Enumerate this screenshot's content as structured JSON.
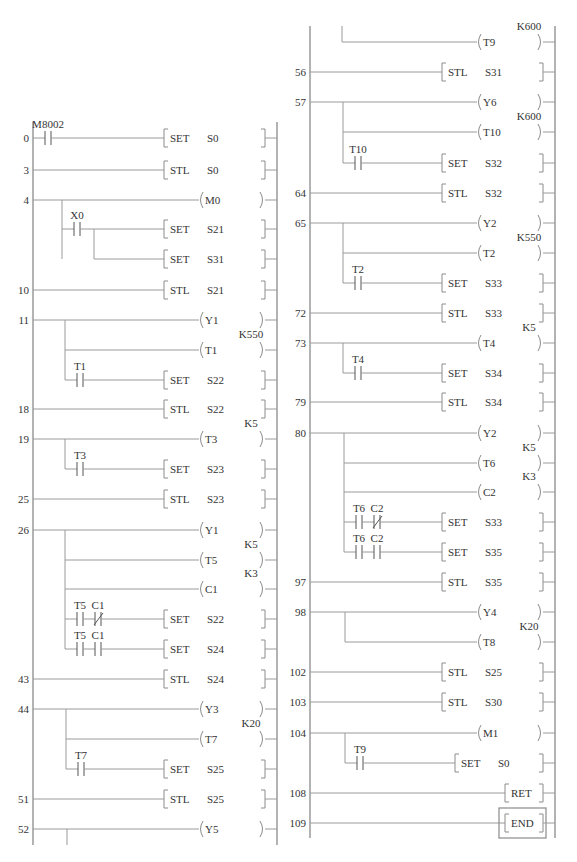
{
  "diagram": {
    "type": "plc-ladder-diagram-stl",
    "columns": [
      {
        "name": "left",
        "rungs": [
          {
            "step": "0",
            "contacts": [
              {
                "label": "M8002",
                "type": "NO"
              }
            ],
            "output": {
              "kind": "instr",
              "op": "SET",
              "operand": "S0"
            }
          },
          {
            "step": "3",
            "output": {
              "kind": "instr",
              "op": "STL",
              "operand": "S0"
            }
          },
          {
            "step": "4",
            "output": {
              "kind": "coil",
              "operand": "M0"
            }
          },
          {
            "branch_of": "4",
            "contacts": [
              {
                "label": "X0",
                "type": "NO"
              }
            ],
            "output": {
              "kind": "instr",
              "op": "SET",
              "operand": "S21"
            }
          },
          {
            "branch_of": "4",
            "output": {
              "kind": "instr",
              "op": "SET",
              "operand": "S31"
            }
          },
          {
            "step": "10",
            "output": {
              "kind": "instr",
              "op": "STL",
              "operand": "S21"
            }
          },
          {
            "step": "11",
            "output": {
              "kind": "coil",
              "operand": "Y1"
            }
          },
          {
            "branch_of": "11",
            "output": {
              "kind": "coil",
              "operand": "T1",
              "preset": "K550"
            }
          },
          {
            "branch_of": "11",
            "contacts": [
              {
                "label": "T1",
                "type": "NO"
              }
            ],
            "output": {
              "kind": "instr",
              "op": "SET",
              "operand": "S22"
            }
          },
          {
            "step": "18",
            "output": {
              "kind": "instr",
              "op": "STL",
              "operand": "S22"
            }
          },
          {
            "step": "19",
            "output": {
              "kind": "coil",
              "operand": "T3",
              "preset": "K5"
            }
          },
          {
            "branch_of": "19",
            "contacts": [
              {
                "label": "T3",
                "type": "NO"
              }
            ],
            "output": {
              "kind": "instr",
              "op": "SET",
              "operand": "S23"
            }
          },
          {
            "step": "25",
            "output": {
              "kind": "instr",
              "op": "STL",
              "operand": "S23"
            }
          },
          {
            "step": "26",
            "output": {
              "kind": "coil",
              "operand": "Y1"
            }
          },
          {
            "branch_of": "26",
            "output": {
              "kind": "coil",
              "operand": "T5",
              "preset": "K5"
            }
          },
          {
            "branch_of": "26",
            "output": {
              "kind": "coil",
              "operand": "C1",
              "preset": "K3"
            }
          },
          {
            "branch_of": "26",
            "contacts": [
              {
                "label": "T5",
                "type": "NO"
              },
              {
                "label": "C1",
                "type": "NC"
              }
            ],
            "output": {
              "kind": "instr",
              "op": "SET",
              "operand": "S22"
            }
          },
          {
            "branch_of": "26",
            "contacts": [
              {
                "label": "T5",
                "type": "NO"
              },
              {
                "label": "C1",
                "type": "NO"
              }
            ],
            "output": {
              "kind": "instr",
              "op": "SET",
              "operand": "S24"
            }
          },
          {
            "step": "43",
            "output": {
              "kind": "instr",
              "op": "STL",
              "operand": "S24"
            }
          },
          {
            "step": "44",
            "output": {
              "kind": "coil",
              "operand": "Y3"
            }
          },
          {
            "branch_of": "44",
            "output": {
              "kind": "coil",
              "operand": "T7",
              "preset": "K20"
            }
          },
          {
            "branch_of": "44",
            "contacts": [
              {
                "label": "T7",
                "type": "NO"
              }
            ],
            "output": {
              "kind": "instr",
              "op": "SET",
              "operand": "S25"
            }
          },
          {
            "step": "51",
            "output": {
              "kind": "instr",
              "op": "STL",
              "operand": "S25"
            }
          },
          {
            "step": "52",
            "output": {
              "kind": "coil",
              "operand": "Y5"
            }
          }
        ]
      },
      {
        "name": "right",
        "rungs": [
          {
            "branch_of": "52",
            "output": {
              "kind": "coil",
              "operand": "T9",
              "preset": "K600"
            }
          },
          {
            "step": "56",
            "output": {
              "kind": "instr",
              "op": "STL",
              "operand": "S31"
            }
          },
          {
            "step": "57",
            "output": {
              "kind": "coil",
              "operand": "Y6"
            }
          },
          {
            "branch_of": "57",
            "output": {
              "kind": "coil",
              "operand": "T10",
              "preset": "K600"
            }
          },
          {
            "branch_of": "57",
            "contacts": [
              {
                "label": "T10",
                "type": "NO"
              }
            ],
            "output": {
              "kind": "instr",
              "op": "SET",
              "operand": "S32"
            }
          },
          {
            "step": "64",
            "output": {
              "kind": "instr",
              "op": "STL",
              "operand": "S32"
            }
          },
          {
            "step": "65",
            "output": {
              "kind": "coil",
              "operand": "Y2"
            }
          },
          {
            "branch_of": "65",
            "output": {
              "kind": "coil",
              "operand": "T2",
              "preset": "K550"
            }
          },
          {
            "branch_of": "65",
            "contacts": [
              {
                "label": "T2",
                "type": "NO"
              }
            ],
            "output": {
              "kind": "instr",
              "op": "SET",
              "operand": "S33"
            }
          },
          {
            "step": "72",
            "output": {
              "kind": "instr",
              "op": "STL",
              "operand": "S33"
            }
          },
          {
            "step": "73",
            "output": {
              "kind": "coil",
              "operand": "T4",
              "preset": "K5"
            }
          },
          {
            "branch_of": "73",
            "contacts": [
              {
                "label": "T4",
                "type": "NO"
              }
            ],
            "output": {
              "kind": "instr",
              "op": "SET",
              "operand": "S34"
            }
          },
          {
            "step": "79",
            "output": {
              "kind": "instr",
              "op": "STL",
              "operand": "S34"
            }
          },
          {
            "step": "80",
            "output": {
              "kind": "coil",
              "operand": "Y2"
            }
          },
          {
            "branch_of": "80",
            "output": {
              "kind": "coil",
              "operand": "T6",
              "preset": "K5"
            }
          },
          {
            "branch_of": "80",
            "output": {
              "kind": "coil",
              "operand": "C2",
              "preset": "K3"
            }
          },
          {
            "branch_of": "80",
            "contacts": [
              {
                "label": "T6",
                "type": "NO"
              },
              {
                "label": "C2",
                "type": "NC"
              }
            ],
            "output": {
              "kind": "instr",
              "op": "SET",
              "operand": "S33"
            }
          },
          {
            "branch_of": "80",
            "contacts": [
              {
                "label": "T6",
                "type": "NO"
              },
              {
                "label": "C2",
                "type": "NO"
              }
            ],
            "output": {
              "kind": "instr",
              "op": "SET",
              "operand": "S35"
            }
          },
          {
            "step": "97",
            "output": {
              "kind": "instr",
              "op": "STL",
              "operand": "S35"
            }
          },
          {
            "step": "98",
            "output": {
              "kind": "coil",
              "operand": "Y4"
            }
          },
          {
            "branch_of": "98",
            "output": {
              "kind": "coil",
              "operand": "T8",
              "preset": "K20"
            }
          },
          {
            "step": "102",
            "output": {
              "kind": "instr",
              "op": "STL",
              "operand": "S25"
            }
          },
          {
            "step": "103",
            "output": {
              "kind": "instr",
              "op": "STL",
              "operand": "S30"
            }
          },
          {
            "step": "104",
            "output": {
              "kind": "coil",
              "operand": "M1"
            }
          },
          {
            "branch_of": "104",
            "contacts": [
              {
                "label": "T9",
                "type": "NO"
              }
            ],
            "output": {
              "kind": "instr",
              "op": "SET",
              "operand": "S0"
            }
          },
          {
            "step": "108",
            "output": {
              "kind": "instr",
              "op": "RET"
            }
          },
          {
            "step": "109",
            "output": {
              "kind": "instr",
              "op": "END",
              "boxed": true
            }
          }
        ]
      }
    ]
  },
  "colors": {
    "line": "#9a9a9a",
    "text": "#333333",
    "background": "#ffffff"
  }
}
